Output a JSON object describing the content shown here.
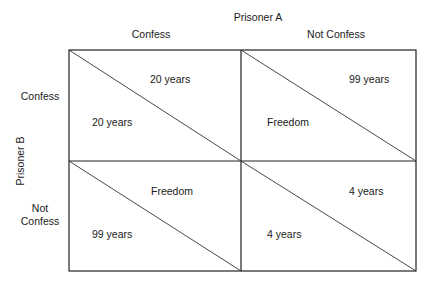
{
  "column_player": {
    "label": "Prisoner A",
    "strategies": [
      "Confess",
      "Not Confess"
    ]
  },
  "row_player": {
    "label": "Prisoner B",
    "strategies": [
      "Confess",
      "Not Confess"
    ],
    "strategy_lines": [
      [
        "Confess"
      ],
      [
        "Not",
        "Confess"
      ]
    ]
  },
  "cells": [
    {
      "row": "Confess",
      "col": "Confess",
      "payoff_a": "20 years",
      "payoff_b": "20 years"
    },
    {
      "row": "Confess",
      "col": "Not Confess",
      "payoff_a": "99 years",
      "payoff_b": "Freedom"
    },
    {
      "row": "Not Confess",
      "col": "Confess",
      "payoff_a": "Freedom",
      "payoff_b": "99 years"
    },
    {
      "row": "Not Confess",
      "col": "Not Confess",
      "payoff_a": "4 years",
      "payoff_b": "4 years"
    }
  ],
  "colors": {
    "line": "#222222",
    "text": "#1a1a1a",
    "background": "#ffffff"
  }
}
